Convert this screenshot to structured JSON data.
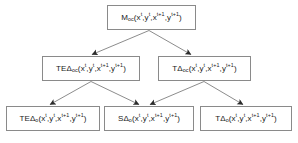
{
  "figure": {
    "type": "hierarchical-tree-diagram",
    "width": 298,
    "height": 143,
    "background_color": "#ffffff",
    "box_border_color": "#8a8a8a",
    "edge_color": "#6e6e6e",
    "text_color": "#1a1a1a",
    "levels": 3
  },
  "nodes": {
    "moc": {
      "id": "moc",
      "level": 1,
      "prefix": "M",
      "subscript": "oc",
      "delta": "",
      "args": "(x^t,y^t,x^{t+1},y^{t+1})",
      "plain_text": "M_oc(x^t,y^t,x^t+1,y^t+1)"
    },
    "teDoc": {
      "id": "teDoc",
      "level": 2,
      "prefix": "TE",
      "delta": "Δ",
      "subscript": "oc",
      "args": "(x^t,y^t,x^{t+1},y^{t+1})",
      "plain_text": "TEΔ_oc(x^t,y^t,x^t+1,y^t+1)"
    },
    "tDoc": {
      "id": "tDoc",
      "level": 2,
      "prefix": "T",
      "delta": "Δ",
      "subscript": "oc",
      "args": "(x^t,y^t,x^{t+1},y^{t+1})",
      "plain_text": "TΔ_oc(x^t,y^t,x^t+1,y^t+1)"
    },
    "teDo": {
      "id": "teDo",
      "level": 3,
      "prefix": "TE",
      "delta": "Δ",
      "subscript": "o",
      "args": "(x^t,y^t,x^{t+1},y^{t+1})",
      "plain_text": "TEΔ_o(x^t,y^t,x^t+1,y^t+1)"
    },
    "sDo": {
      "id": "sDo",
      "level": 3,
      "prefix": "S",
      "delta": "Δ",
      "subscript": "o",
      "args": "(x^t,y^t,x^{t+1},y^{t+1})",
      "plain_text": "SΔ_o(x^t,y^t,x^t+1,y^t+1)"
    },
    "tDo": {
      "id": "tDo",
      "level": 3,
      "prefix": "T",
      "delta": "Δ",
      "subscript": "o",
      "args": "(x^t,y^t,x^{t+1},y^{t+1})",
      "plain_text": "TΔ_o(x^t,y^t,x^t+1,y^t+1)"
    }
  },
  "variables": {
    "x_t": "x",
    "y_t": "y",
    "sup_t": "t",
    "sup_t1": "t+1",
    "open_paren": "(",
    "close_paren": ")",
    "comma": ","
  },
  "edges": [
    {
      "from": "moc",
      "to": "teDoc",
      "label": ""
    },
    {
      "from": "moc",
      "to": "tDoc",
      "label": ""
    },
    {
      "from": "teDoc",
      "to": "teDo",
      "label": ""
    },
    {
      "from": "teDoc",
      "to": "sDo",
      "label": ""
    },
    {
      "from": "tDoc",
      "to": "sDo",
      "label": ""
    },
    {
      "from": "tDoc",
      "to": "tDo",
      "label": ""
    }
  ]
}
